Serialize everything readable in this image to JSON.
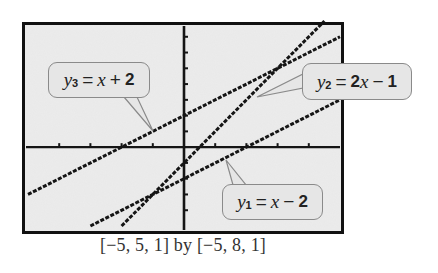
{
  "caption": "[−5, 5, 1] by [−5, 8, 1]",
  "callouts": {
    "y3": {
      "var": "y",
      "sub": "3",
      "eq": "=",
      "rhs_var": "x",
      "op": "+",
      "num": "2"
    },
    "y2": {
      "var": "y",
      "sub": "2",
      "eq": "=",
      "rhs_coef": "2",
      "rhs_var": "x",
      "op": "−",
      "num": "1"
    },
    "y1": {
      "var": "y",
      "sub": "1",
      "eq": "=",
      "rhs_var": "x",
      "op": "−",
      "num": "2"
    }
  },
  "colors": {
    "frame": "#111111",
    "plot_bg": "#ececec",
    "line": "#151515",
    "callout_bg": "#e6e6e6",
    "callout_border": "#8a8a8a"
  },
  "chart_data": {
    "type": "line",
    "title": "",
    "caption": "[−5, 5, 1] by [−5, 8, 1]",
    "xlabel": "",
    "ylabel": "",
    "xlim": [
      -5,
      5
    ],
    "ylim": [
      -5,
      8
    ],
    "xscl": 1,
    "yscl": 1,
    "grid": false,
    "axes_ticks": true,
    "style": "graphing-calculator pixel plot",
    "series": [
      {
        "name": "y1 = x - 2",
        "expression": "x - 2",
        "slope": 1,
        "intercept": -2,
        "x": [
          -3,
          -2,
          -1,
          0,
          1,
          2,
          3,
          4,
          5
        ],
        "y": [
          -5,
          -4,
          -3,
          -2,
          -1,
          0,
          1,
          2,
          3
        ]
      },
      {
        "name": "y2 = 2x - 1",
        "expression": "2x - 1",
        "slope": 2,
        "intercept": -1,
        "x": [
          -2,
          -1,
          0,
          1,
          2,
          3,
          4,
          4.5
        ],
        "y": [
          -5,
          -3,
          -1,
          1,
          3,
          5,
          7,
          8
        ]
      },
      {
        "name": "y3 = x + 2",
        "expression": "x + 2",
        "slope": 1,
        "intercept": 2,
        "x": [
          -5,
          -4,
          -3,
          -2,
          -1,
          0,
          1,
          2,
          3,
          4,
          5
        ],
        "y": [
          -3,
          -2,
          -1,
          0,
          1,
          2,
          3,
          4,
          5,
          6,
          7
        ]
      }
    ],
    "annotations": [
      {
        "text": "y3 = x + 2",
        "points_to": [
          -1,
          1
        ]
      },
      {
        "text": "y2 = 2x - 1",
        "points_to": [
          2.4,
          3.8
        ]
      },
      {
        "text": "y1 = x - 2",
        "points_to": [
          1.4,
          -0.6
        ]
      }
    ]
  }
}
